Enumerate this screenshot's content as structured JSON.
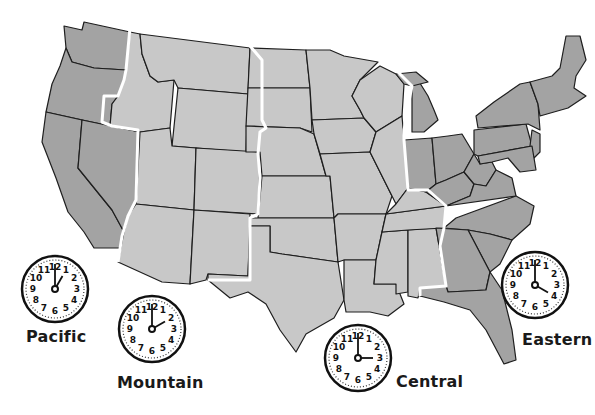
{
  "map": {
    "title": "U.S. Time Zones",
    "colors": {
      "pacific": "#a3a3a3",
      "mountain": "#c8c8c8",
      "central": "#c8c8c8",
      "eastern": "#a3a3a3",
      "state_border": "#1e1e1e",
      "zone_border": "#ffffff",
      "background": "#ffffff"
    }
  },
  "zones": [
    {
      "id": "pacific",
      "label": "Pacific",
      "clock_time": "1:00",
      "hour": 1,
      "minute": 0
    },
    {
      "id": "mountain",
      "label": "Mountain",
      "clock_time": "2:00",
      "hour": 2,
      "minute": 0
    },
    {
      "id": "central",
      "label": "Central",
      "clock_time": "3:00",
      "hour": 3,
      "minute": 0
    },
    {
      "id": "eastern",
      "label": "Eastern",
      "clock_time": "4:00",
      "hour": 4,
      "minute": 0
    }
  ],
  "clock_numerals": [
    "12",
    "1",
    "2",
    "3",
    "4",
    "5",
    "6",
    "7",
    "8",
    "9",
    "10",
    "11"
  ]
}
